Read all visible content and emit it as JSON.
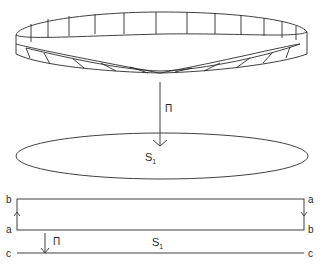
{
  "figure": {
    "band": {
      "name": "Möbius band"
    },
    "projection_top": {
      "label": "Π"
    },
    "circle": {
      "label_main": "S",
      "label_sub": "1"
    },
    "rectangle": {
      "top_left": "b",
      "bottom_left": "a",
      "top_right": "a",
      "bottom_right": "b"
    },
    "projection_bottom": {
      "label": "Π"
    },
    "base_line": {
      "left": "c",
      "right": "c",
      "label_main": "S",
      "label_sub": "1"
    },
    "colors": {
      "line": "#2a2a2a",
      "background": "#ffffff"
    }
  }
}
